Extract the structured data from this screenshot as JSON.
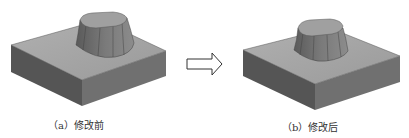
{
  "figures": [
    {
      "id": "a",
      "caption": "（a）修改前",
      "description": "Square base block with a tapered rounded-rectangle boss (before modification)"
    },
    {
      "id": "b",
      "caption": "（b）修改后",
      "description": "Square base block with a smaller tapered rounded-rectangle boss (after modification)"
    }
  ],
  "arrow": {
    "icon": "right-arrow-outline-icon"
  },
  "colors": {
    "top_face": "#a3a3a3",
    "left_face": "#555555",
    "right_face": "#707070",
    "boss_top": "#9c9c9c",
    "boss_side": "#6a6a6a",
    "edge": "#3a3a3a"
  }
}
